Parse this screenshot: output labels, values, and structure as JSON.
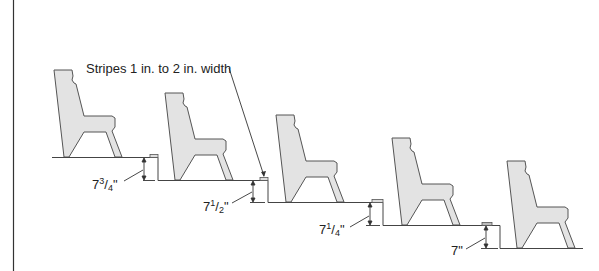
{
  "diagram": {
    "type": "stepped seating cross-section",
    "annotation": "Stripes 1 in. to 2 in. width",
    "riser_labels": [
      {
        "whole": "7",
        "num": "3",
        "den": "4",
        "unit": "\""
      },
      {
        "whole": "7",
        "num": "1",
        "den": "2",
        "unit": "\""
      },
      {
        "whole": "7",
        "num": "1",
        "den": "4",
        "unit": "\""
      },
      {
        "whole": "7",
        "num": "",
        "den": "",
        "unit": "\""
      }
    ],
    "seats_count": 5,
    "colors": {
      "chair_fill": "#e3e3e3",
      "line": "#333333",
      "text": "#222222"
    }
  }
}
